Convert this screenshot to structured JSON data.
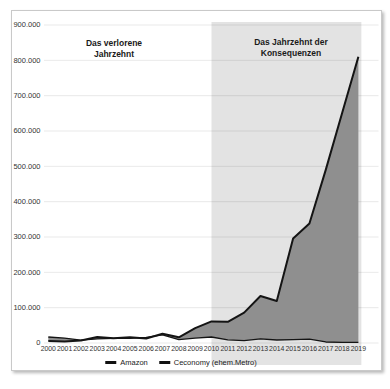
{
  "chart": {
    "colors": {
      "line": "#141414",
      "area_fill": "#8f8f8f",
      "region_fill_opacity": 0.11,
      "grid": "#e3e3e3",
      "card_border": "#c9c9c9",
      "tick_text": "#333333"
    },
    "annotations": {
      "left": "Das verlorene Jahrzehnt",
      "right": "Das Jahrzehnt der Konsequenzen"
    }
  },
  "chart_data": {
    "type": "area",
    "title": "",
    "xlabel": "",
    "ylabel": "",
    "x": [
      2000,
      2001,
      2002,
      2003,
      2004,
      2005,
      2006,
      2007,
      2008,
      2009,
      2010,
      2011,
      2012,
      2013,
      2014,
      2015,
      2016,
      2017,
      2018,
      2019
    ],
    "series": [
      {
        "name": "Amazon",
        "values": [
          5500,
          4300,
          7200,
          16800,
          13200,
          16500,
          12500,
          26000,
          16000,
          42000,
          61000,
          60000,
          86000,
          133000,
          119000,
          296000,
          338000,
          490000,
          650000,
          810000
        ]
      },
      {
        "name": "Ceconomy (ehem.Metro)",
        "values": [
          17000,
          14000,
          8000,
          11500,
          13000,
          13500,
          15700,
          23000,
          9500,
          14000,
          17000,
          9000,
          7000,
          11500,
          8500,
          9800,
          11000,
          2900,
          1800,
          1800
        ]
      }
    ],
    "ylim": [
      0,
      900000
    ],
    "ytick_step": 100000,
    "ytick_labels": [
      "0",
      "100.000",
      "200.000",
      "300.000",
      "400.000",
      "500.000",
      "600.000",
      "700.000",
      "800.000",
      "900.000"
    ],
    "grid": true,
    "legend_position": "bottom",
    "fill_between_series": true,
    "shaded_region": {
      "x_from": 2010,
      "x_to": 2019,
      "label": "Das Jahrzehnt der Konsequenzen"
    },
    "annotations": [
      {
        "text": "Das verlorene Jahrzehnt",
        "span": "2000-2009"
      },
      {
        "text": "Das Jahrzehnt der Konsequenzen",
        "span": "2010-2019"
      }
    ]
  }
}
